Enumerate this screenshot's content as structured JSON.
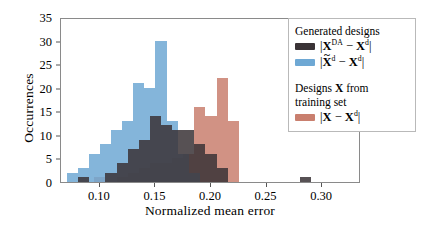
{
  "chart_data": {
    "type": "bar",
    "title": "",
    "xlabel": "Normalized mean error",
    "ylabel": "Occurrences",
    "xlim": [
      0.065,
      0.335
    ],
    "ylim": [
      0,
      35
    ],
    "xticks": [
      0.1,
      0.15,
      0.2,
      0.25,
      0.3
    ],
    "xticklabels": [
      "0.10",
      "0.15",
      "0.20",
      "0.25",
      "0.30"
    ],
    "yticks": [
      0,
      5,
      10,
      15,
      20,
      25,
      30,
      35
    ],
    "yticklabels": [
      "0",
      "5",
      "10",
      "15",
      "20",
      "25",
      "30",
      "35"
    ],
    "grid": false,
    "bin_width": 0.01,
    "series": [
      {
        "name": "|X^DA - X^d|",
        "legend_label": "|X^DA − X^d|",
        "color": "#3a3336",
        "alpha": 0.85,
        "bin_starts": [
          0.08,
          0.105,
          0.115,
          0.125,
          0.135,
          0.145,
          0.155,
          0.165,
          0.175,
          0.185,
          0.195,
          0.205,
          0.28
        ],
        "values": [
          1,
          2,
          4,
          7,
          9,
          14,
          12,
          11,
          11,
          8,
          6,
          3,
          1
        ]
      },
      {
        "name": "|Xtilde^d - X^d|",
        "legend_label": "|X̃^d − X^d|",
        "color": "#6ea8d4",
        "alpha": 0.85,
        "bin_starts": [
          0.07,
          0.08,
          0.09,
          0.1,
          0.11,
          0.12,
          0.13,
          0.14,
          0.15,
          0.16,
          0.17,
          0.18
        ],
        "values": [
          2,
          3,
          6,
          8,
          11,
          13,
          21,
          20,
          30,
          13,
          6,
          2
        ]
      },
      {
        "name": "|X - X^d|",
        "legend_label": "|X − X^d|",
        "color": "#c97f6e",
        "alpha": 0.85,
        "bin_starts": [
          0.095,
          0.115,
          0.125,
          0.135,
          0.145,
          0.155,
          0.165,
          0.175,
          0.185,
          0.195,
          0.205,
          0.215
        ],
        "values": [
          1,
          1,
          2,
          3,
          4,
          4,
          5,
          6,
          16,
          14,
          22,
          13
        ]
      }
    ]
  },
  "legend": {
    "group1_title": "Generated designs",
    "group2_title_line1_pre": "Designs ",
    "group2_title_line1_bold": "X",
    "group2_title_line1_post": " from",
    "group2_title_line2": "training set"
  }
}
